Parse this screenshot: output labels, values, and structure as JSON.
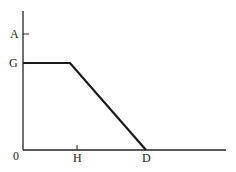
{
  "diagram": {
    "type": "piecewise-linear-graph",
    "colors": {
      "line": "#1a1a1a",
      "axis": "#222222",
      "background": "#ffffff"
    },
    "labels": {
      "y_axis": [
        {
          "id": "A",
          "text": "A"
        },
        {
          "id": "G",
          "text": "G"
        }
      ],
      "origin": "0",
      "x_axis": [
        {
          "id": "H",
          "text": "H"
        },
        {
          "id": "D",
          "text": "D"
        }
      ]
    },
    "curve": {
      "description": "Horizontal at level G from 0 to just before H, then straight line down to zero at D",
      "points": [
        {
          "x": "0",
          "y": "G"
        },
        {
          "x": "near H",
          "y": "G"
        },
        {
          "x": "D",
          "y": "0"
        }
      ]
    }
  }
}
